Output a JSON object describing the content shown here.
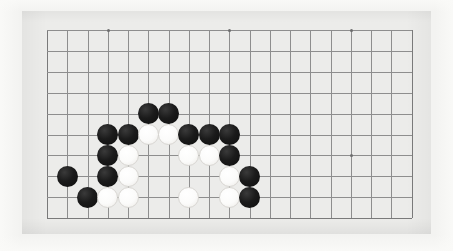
{
  "image": {
    "kind": "go-board-photo",
    "width": 453,
    "height": 251,
    "caption": ""
  },
  "colors": {
    "page_background": "#f2f2f0",
    "board_surface": "#ececea",
    "grid_line": "#8e8e8e",
    "edge_line": "#7a7a7a",
    "star_point": "#6d6d6d",
    "black_stone": "#141414",
    "white_stone": "#fbfbfa",
    "white_stone_outline": "#d8d6d2"
  },
  "board": {
    "label": "Go board diagram",
    "columns": 19,
    "rows_visible": 10,
    "origin_x": 47,
    "origin_y": 30,
    "spacing_x": 20.25,
    "spacing_y": 20.9,
    "stone_diameter": 21,
    "bottom_edge_row": 9,
    "star_points": [
      {
        "col": 3,
        "row": 0
      },
      {
        "col": 9,
        "row": 0
      },
      {
        "col": 15,
        "row": 0
      },
      {
        "col": 15,
        "row": 6
      }
    ]
  },
  "stones": [
    {
      "color": "black",
      "col": 5,
      "row": 4
    },
    {
      "color": "black",
      "col": 6,
      "row": 4
    },
    {
      "color": "black",
      "col": 3,
      "row": 5
    },
    {
      "color": "black",
      "col": 4,
      "row": 5
    },
    {
      "color": "white",
      "col": 5,
      "row": 5
    },
    {
      "color": "white",
      "col": 6,
      "row": 5
    },
    {
      "color": "black",
      "col": 7,
      "row": 5
    },
    {
      "color": "black",
      "col": 8,
      "row": 5
    },
    {
      "color": "black",
      "col": 9,
      "row": 5
    },
    {
      "color": "black",
      "col": 3,
      "row": 6
    },
    {
      "color": "white",
      "col": 4,
      "row": 6
    },
    {
      "color": "white",
      "col": 7,
      "row": 6
    },
    {
      "color": "white",
      "col": 8,
      "row": 6
    },
    {
      "color": "black",
      "col": 9,
      "row": 6
    },
    {
      "color": "black",
      "col": 1,
      "row": 7
    },
    {
      "color": "black",
      "col": 3,
      "row": 7
    },
    {
      "color": "white",
      "col": 4,
      "row": 7
    },
    {
      "color": "white",
      "col": 9,
      "row": 7
    },
    {
      "color": "black",
      "col": 10,
      "row": 7
    },
    {
      "color": "black",
      "col": 2,
      "row": 8
    },
    {
      "color": "white",
      "col": 3,
      "row": 8
    },
    {
      "color": "white",
      "col": 4,
      "row": 8
    },
    {
      "color": "white",
      "col": 7,
      "row": 8
    },
    {
      "color": "white",
      "col": 9,
      "row": 8
    },
    {
      "color": "black",
      "col": 10,
      "row": 8
    }
  ],
  "counts": {
    "black_stones": 14,
    "white_stones": 11,
    "total_stones": 25
  }
}
